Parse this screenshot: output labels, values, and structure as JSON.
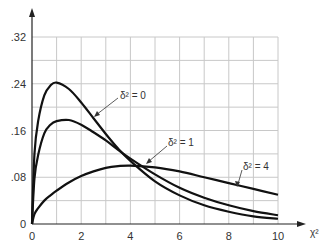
{
  "chart_data": {
    "type": "line",
    "title": "",
    "xlabel": "χ²",
    "ylabel": "",
    "xlim": [
      0,
      10
    ],
    "ylim": [
      0,
      0.32
    ],
    "grid": true,
    "x_ticks": [
      0,
      2,
      4,
      6,
      8,
      10
    ],
    "x_tick_labels": [
      "0",
      "2",
      "4",
      "6",
      "8",
      "10"
    ],
    "y_ticks": [
      0,
      0.08,
      0.16,
      0.24,
      0.32
    ],
    "y_tick_labels": [
      "0",
      ".08",
      ".16",
      ".24",
      ".32"
    ],
    "x": [
      0,
      0.1,
      0.25,
      0.5,
      0.75,
      1,
      1.5,
      2,
      2.5,
      3,
      3.5,
      4,
      5,
      6,
      7,
      8,
      9,
      10
    ],
    "series": [
      {
        "name": "δ² = 0",
        "label": "δ² = 0",
        "values": [
          0,
          0.12,
          0.176,
          0.22,
          0.237,
          0.242,
          0.231,
          0.208,
          0.181,
          0.154,
          0.129,
          0.108,
          0.073,
          0.049,
          0.032,
          0.021,
          0.013,
          0.009
        ]
      },
      {
        "name": "δ² = 1",
        "label": "δ² = 1",
        "values": [
          0,
          0.078,
          0.118,
          0.155,
          0.17,
          0.176,
          0.178,
          0.17,
          0.157,
          0.143,
          0.127,
          0.112,
          0.085,
          0.062,
          0.045,
          0.032,
          0.022,
          0.015
        ]
      },
      {
        "name": "δ² = 4",
        "label": "δ² = 4",
        "values": [
          0,
          0.017,
          0.027,
          0.04,
          0.049,
          0.057,
          0.071,
          0.082,
          0.09,
          0.096,
          0.099,
          0.1,
          0.097,
          0.09,
          0.08,
          0.07,
          0.06,
          0.05
        ]
      }
    ],
    "annotations": [
      {
        "text": "δ² = 0",
        "points_to_series": 0
      },
      {
        "text": "δ² = 1",
        "points_to_series": 1
      },
      {
        "text": "δ² = 4",
        "points_to_series": 2
      }
    ]
  }
}
